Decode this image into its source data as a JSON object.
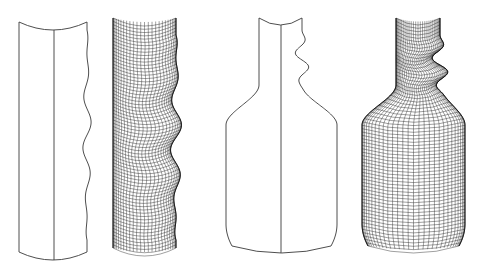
{
  "figure": {
    "background_color": "#ffffff",
    "line_color": "#3a3a3a",
    "panels": [
      {
        "id": "wavy-cylinder-outline",
        "type": "outline",
        "x_left": 19,
        "x_center": 54,
        "x_right_base": 87,
        "y_top": 22,
        "y_bottom": 252,
        "cap_depth": 8,
        "waves": 4,
        "wave_amplitude": 6,
        "wave_top": 30,
        "wave_bottom": 240
      },
      {
        "id": "wavy-cylinder-mesh",
        "type": "mesh",
        "x_left": 113,
        "x_right_base": 176,
        "y_top": 18,
        "y_bottom": 248,
        "cap_depth": 8,
        "waves": 4,
        "wave_amplitude": 8,
        "wave_top": 35,
        "wave_bottom": 240,
        "rings": 70,
        "meridians": 26
      },
      {
        "id": "bottle-outline",
        "type": "outline",
        "neck_left": 259,
        "neck_right": 302,
        "x_center": 281,
        "body_left": 226,
        "body_right": 337,
        "y_top": 18,
        "y_shoulder_start": 85,
        "y_shoulder_end": 125,
        "y_bottom": 246,
        "cap_depth": 7,
        "waves": 2,
        "wave_amplitude": 6,
        "wave_top": 30,
        "wave_bottom": 90
      },
      {
        "id": "bottle-mesh",
        "type": "mesh",
        "neck_left": 396,
        "neck_right": 440,
        "body_left": 362,
        "body_right": 465,
        "y_top": 18,
        "y_shoulder_start": 85,
        "y_shoulder_end": 125,
        "y_bottom": 246,
        "cap_depth": 7,
        "waves": 2,
        "wave_amplitude": 7,
        "wave_top": 35,
        "wave_bottom": 95,
        "rings": 68,
        "meridians": 30
      }
    ]
  }
}
